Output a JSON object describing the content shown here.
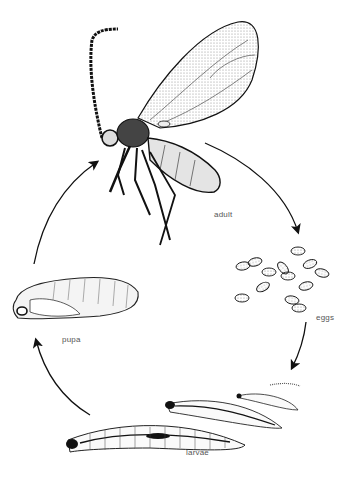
{
  "diagram": {
    "type": "cycle",
    "stages": [
      {
        "id": "adult",
        "label": "adult"
      },
      {
        "id": "eggs",
        "label": "eggs"
      },
      {
        "id": "larvae",
        "label": "larvae"
      },
      {
        "id": "pupa",
        "label": "pupa"
      }
    ],
    "edges": [
      {
        "from": "adult",
        "to": "eggs"
      },
      {
        "from": "eggs",
        "to": "larvae"
      },
      {
        "from": "larvae",
        "to": "pupa"
      },
      {
        "from": "pupa",
        "to": "adult"
      }
    ],
    "colors": {
      "ink": "#111111",
      "label": "#555555",
      "background": "#ffffff"
    }
  }
}
